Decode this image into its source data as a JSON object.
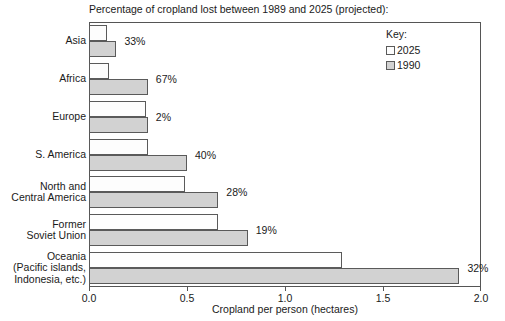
{
  "chart_data": {
    "type": "bar",
    "orientation": "horizontal",
    "title": "Percentage of cropland lost between 1989 and 2025 (projected):",
    "xlabel": "Cropland per person (hectares)",
    "ylabel": "",
    "xlim": [
      0.0,
      2.0
    ],
    "xticks": [
      "0.0",
      "0.5",
      "1.0",
      "1.5",
      "2.0"
    ],
    "xtick_values": [
      0.0,
      0.5,
      1.0,
      1.5,
      2.0
    ],
    "grid": false,
    "legend_position": "top-right",
    "legend_title": "Key:",
    "categories": [
      "Asia",
      "Africa",
      "Europe",
      "S. America",
      "North and\nCentral America",
      "Former\nSoviet Union",
      "Oceania\n(Pacific islands,\nIndonesia, etc.)"
    ],
    "series": [
      {
        "name": "2025",
        "color": "#fdfdfd",
        "values": [
          0.09,
          0.1,
          0.29,
          0.3,
          0.49,
          0.66,
          1.29
        ]
      },
      {
        "name": "1990",
        "color": "#d2d2d2",
        "values": [
          0.14,
          0.3,
          0.3,
          0.5,
          0.66,
          0.81,
          1.89
        ]
      }
    ],
    "annotations": [
      "33%",
      "67%",
      "2%",
      "40%",
      "28%",
      "19%",
      "32%"
    ],
    "annotation_meaning": "percentage of cropland lost between 1989 and 2025 (projected)"
  },
  "rows": [
    {
      "label": "Asia",
      "lines": [
        "Asia"
      ],
      "v2025": 0.09,
      "v1990": 0.14,
      "pct": "33%"
    },
    {
      "label": "Africa",
      "lines": [
        "Africa"
      ],
      "v2025": 0.1,
      "v1990": 0.3,
      "pct": "67%"
    },
    {
      "label": "Europe",
      "lines": [
        "Europe"
      ],
      "v2025": 0.29,
      "v1990": 0.3,
      "pct": "2%"
    },
    {
      "label": "S. America",
      "lines": [
        "S. America"
      ],
      "v2025": 0.3,
      "v1990": 0.5,
      "pct": "40%"
    },
    {
      "label": "North and Central America",
      "lines": [
        "North and",
        "Central America"
      ],
      "v2025": 0.49,
      "v1990": 0.66,
      "pct": "28%"
    },
    {
      "label": "Former Soviet Union",
      "lines": [
        "Former",
        "Soviet Union"
      ],
      "v2025": 0.66,
      "v1990": 0.81,
      "pct": "19%"
    },
    {
      "label": "Oceania (Pacific islands, Indonesia, etc.)",
      "lines": [
        "Oceania",
        "(Pacific islands,",
        "Indonesia, etc.)"
      ],
      "v2025": 1.29,
      "v1990": 1.89,
      "pct": "32%"
    }
  ],
  "legend": {
    "title": "Key:",
    "items": [
      {
        "label": "2025",
        "swatch": "y2025"
      },
      {
        "label": "1990",
        "swatch": "y1990"
      }
    ]
  },
  "axis": {
    "x_title": "Cropland per person (hectares)",
    "ticks": [
      "0.0",
      "0.5",
      "1.0",
      "1.5",
      "2.0"
    ]
  }
}
